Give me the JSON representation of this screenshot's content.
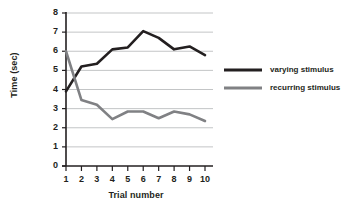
{
  "chart_data": {
    "type": "line",
    "title": "",
    "xlabel": "Trial number",
    "ylabel": "Time (sec)",
    "x": [
      1,
      2,
      3,
      4,
      5,
      6,
      7,
      8,
      9,
      10
    ],
    "categories": [
      "1",
      "2",
      "3",
      "4",
      "5",
      "6",
      "7",
      "8",
      "9",
      "10"
    ],
    "xlim": [
      1,
      10
    ],
    "ylim": [
      0,
      8
    ],
    "yticks": [
      0,
      1,
      2,
      3,
      4,
      5,
      6,
      7,
      8
    ],
    "ytick_labels": [
      "0",
      "1",
      "2",
      "3",
      "4",
      "5",
      "6",
      "7",
      "8"
    ],
    "grid": "horizontal",
    "legend_position": "right",
    "series": [
      {
        "name": "varying stimulus",
        "color": "#231f20",
        "values": [
          3.9,
          5.2,
          5.35,
          6.1,
          6.2,
          7.05,
          6.7,
          6.1,
          6.25,
          5.8
        ]
      },
      {
        "name": "recurring stimulus",
        "color": "#808184",
        "values": [
          6.0,
          3.45,
          3.2,
          2.45,
          2.85,
          2.85,
          2.5,
          2.85,
          2.7,
          2.35
        ]
      }
    ]
  },
  "legend": {
    "items": [
      {
        "label": "varying stimulus",
        "color": "#231f20"
      },
      {
        "label": "recurring stimulus",
        "color": "#808184"
      }
    ]
  },
  "colors": {
    "axis": "#231f20",
    "grid": "#bcbec0",
    "text": "#231f20",
    "background": "#ffffff"
  }
}
